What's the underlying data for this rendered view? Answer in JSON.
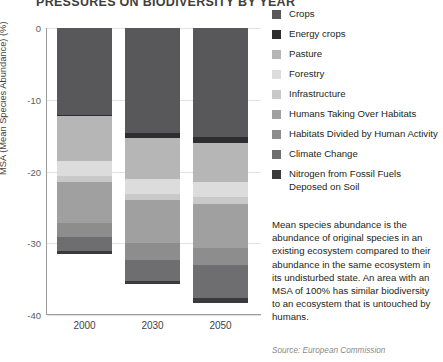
{
  "title": "PRESSURES ON BIODIVERSITY BY YEAR",
  "axis": {
    "ylabel": "MSA (Mean Species Abundance) (%)",
    "yticks": [
      "0",
      "-10",
      "-20",
      "-30",
      "-40"
    ]
  },
  "legend": {
    "items": [
      {
        "label": "Crops",
        "color": "#58585a"
      },
      {
        "label": "Energy crops",
        "color": "#2e2e30"
      },
      {
        "label": "Pasture",
        "color": "#b6b6b6"
      },
      {
        "label": "Forestry",
        "color": "#dcdcdc"
      },
      {
        "label": "Infrastructure",
        "color": "#c9c9c9"
      },
      {
        "label": "Humans Taking Over Habitats",
        "color": "#a0a0a0"
      },
      {
        "label": "Habitats Divided by Human Activity",
        "color": "#8d8d8d"
      },
      {
        "label": "Climate Change",
        "color": "#6e6e70"
      },
      {
        "label": "Nitrogen from Fossil Fuels Deposed on Soil",
        "color": "#3a3a3c"
      }
    ]
  },
  "note": "Mean species abundance is the abundance of original species in an existing ecosystem compared to their abundance in the same ecosystem in its undisturbed state. An area with an MSA of 100% has similar biodiversity to an ecosystem that is untouched by humans.",
  "source": "Source: European Commission",
  "chart_data": {
    "type": "bar",
    "stacked": true,
    "orientation": "vertical-negative",
    "title": "PRESSURES ON BIODIVERSITY BY YEAR",
    "xlabel": "",
    "ylabel": "MSA (Mean Species Abundance) (%)",
    "ylim": [
      -40,
      0
    ],
    "yticks": [
      0,
      -10,
      -20,
      -30,
      -40
    ],
    "grid": true,
    "legend_position": "right",
    "categories": [
      "2000",
      "2030",
      "2050"
    ],
    "series": [
      {
        "name": "Crops",
        "color": "#58585a",
        "values": [
          -12.1,
          -14.6,
          -15.2
        ]
      },
      {
        "name": "Energy crops",
        "color": "#2e2e30",
        "values": [
          -0.2,
          -0.7,
          -0.8
        ]
      },
      {
        "name": "Pasture",
        "color": "#b6b6b6",
        "values": [
          -6.3,
          -5.7,
          -5.5
        ]
      },
      {
        "name": "Forestry",
        "color": "#dcdcdc",
        "values": [
          -2.1,
          -2.1,
          -2.1
        ]
      },
      {
        "name": "Infrastructure",
        "color": "#c9c9c9",
        "values": [
          -0.7,
          -0.9,
          -1.0
        ]
      },
      {
        "name": "Humans Taking Over Habitats",
        "color": "#a0a0a0",
        "values": [
          -5.8,
          -5.9,
          -6.0
        ]
      },
      {
        "name": "Habitats Divided by Human Activity",
        "color": "#8d8d8d",
        "values": [
          -1.9,
          -2.4,
          -2.5
        ]
      },
      {
        "name": "Climate Change",
        "color": "#6e6e70",
        "values": [
          -2.0,
          -2.9,
          -4.5
        ]
      },
      {
        "name": "Nitrogen from Fossil Fuels Deposed on Soil",
        "color": "#3a3a3c",
        "values": [
          -0.4,
          -0.5,
          -0.7
        ]
      }
    ],
    "totals": [
      -31.5,
      -35.7,
      -38.3
    ]
  }
}
